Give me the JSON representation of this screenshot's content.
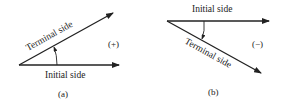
{
  "panels": [
    {
      "id": "a",
      "caption": "(a)",
      "sign": "(+)",
      "initial_label": "Initial side",
      "terminal_label": "Terminal side",
      "direction": "counterclockwise"
    },
    {
      "id": "b",
      "caption": "(b)",
      "sign": "(−)",
      "initial_label": "Initial side",
      "terminal_label": "Terminal side",
      "direction": "clockwise"
    }
  ],
  "colors": {
    "line": "#222222",
    "background": "#ffffff"
  }
}
